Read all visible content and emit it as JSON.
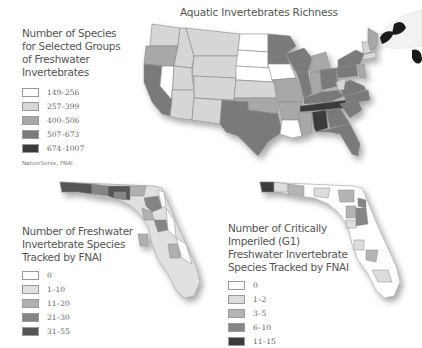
{
  "us_map": {
    "title": "Aquatic Invertebrates Richness",
    "legend": {
      "title_lines": [
        "Number of Species",
        "for Selected Groups",
        "of Freshwater",
        "Invertebrates"
      ],
      "items": [
        {
          "label": "149–256",
          "color": "#ffffff"
        },
        {
          "label": "257–399",
          "color": "#d6d6d6"
        },
        {
          "label": "400–506",
          "color": "#a8a8a8"
        },
        {
          "label": "507–673",
          "color": "#7a7a7a"
        },
        {
          "label": "674–1007",
          "color": "#3a3a3a"
        }
      ]
    },
    "source": "NatureServe, FNAI"
  },
  "florida_map_1": {
    "legend": {
      "title_lines": [
        "Number of Freshwater",
        "Invertebrate Species",
        "Tracked by FNAI"
      ],
      "items": [
        {
          "label": "0",
          "color": "#ffffff"
        },
        {
          "label": "1–10",
          "color": "#e0e0e0"
        },
        {
          "label": "11–20",
          "color": "#b0b0b0"
        },
        {
          "label": "21–30",
          "color": "#858585"
        },
        {
          "label": "31–55",
          "color": "#555555"
        }
      ]
    }
  },
  "florida_map_2": {
    "legend": {
      "title_lines": [
        "Number of Critically",
        "Imperiled (G1)",
        "Freshwater Invertebrate",
        "Species Tracked by FNAI"
      ],
      "items": [
        {
          "label": "0",
          "color": "#ffffff"
        },
        {
          "label": "1–2",
          "color": "#dcdcdc"
        },
        {
          "label": "3–5",
          "color": "#b4b4b4"
        },
        {
          "label": "6–10",
          "color": "#858585"
        },
        {
          "label": "11–15",
          "color": "#3c3c3c"
        }
      ]
    }
  },
  "decoration": {
    "image": "koi-fish-illustration"
  }
}
